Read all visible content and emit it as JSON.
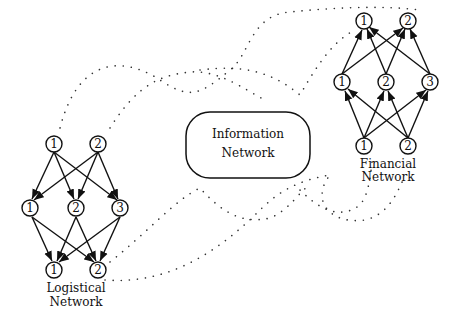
{
  "diagram": {
    "colors": {
      "stroke": "#111111",
      "dots": "#333333",
      "background": "#ffffff"
    },
    "information_network": {
      "label_line1": "Information",
      "label_line2": "Network"
    },
    "logistical_network": {
      "label_line1": "Logistical",
      "label_line2": "Network",
      "top_row": [
        "1",
        "2"
      ],
      "middle_row": [
        "1",
        "2",
        "3"
      ],
      "bottom_row": [
        "1",
        "2"
      ],
      "edge_direction": "downward"
    },
    "financial_network": {
      "label_line1": "Financial",
      "label_line2": "Network",
      "top_row": [
        "1",
        "2"
      ],
      "middle_row": [
        "1",
        "2",
        "3"
      ],
      "bottom_row": [
        "1",
        "2"
      ],
      "edge_direction": "upward"
    }
  }
}
